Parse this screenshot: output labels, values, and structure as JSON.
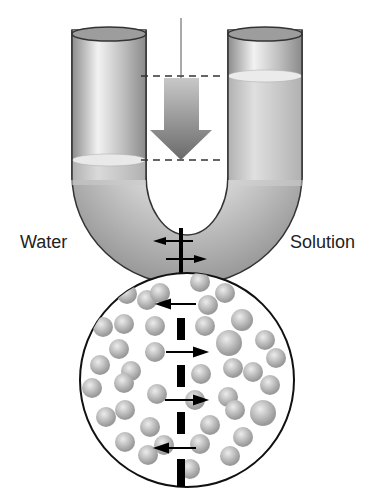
{
  "diagram": {
    "labels": {
      "left": "Water",
      "right": "Solution"
    },
    "colors": {
      "tube": "#bdbdbd",
      "tube_dark": "#8a8a8a",
      "arrow": "#777777",
      "membrane": "#000000",
      "particle": "#c4c4c4"
    }
  }
}
